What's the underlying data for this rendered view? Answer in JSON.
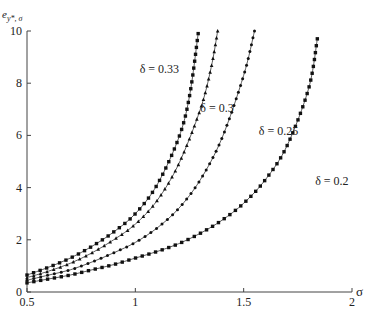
{
  "chart_data": {
    "type": "line",
    "title": "",
    "xlabel": "σ",
    "ylabel": "e_{y*, σ}",
    "xlim": [
      0.5,
      2
    ],
    "ylim": [
      0,
      10
    ],
    "x_ticks": [
      "0.5",
      "1",
      "1.5",
      "2"
    ],
    "y_ticks": [
      "0",
      "2",
      "4",
      "6",
      "8",
      "10"
    ],
    "grid": false,
    "legend": "inline labels",
    "series": [
      {
        "name": "δ = 0.33",
        "marker": "square",
        "x": [
          0.5,
          0.6,
          0.7,
          0.8,
          0.9,
          1.0,
          1.1,
          1.2,
          1.25,
          1.29
        ],
        "y": [
          0.65,
          0.95,
          1.3,
          1.75,
          2.3,
          3.0,
          4.1,
          5.9,
          7.5,
          9.9
        ]
      },
      {
        "name": "δ = 0.3",
        "marker": "triangle",
        "x": [
          0.5,
          0.6,
          0.7,
          0.8,
          0.9,
          1.0,
          1.1,
          1.2,
          1.3,
          1.35,
          1.38
        ],
        "y": [
          0.55,
          0.8,
          1.1,
          1.5,
          2.0,
          2.6,
          3.5,
          4.9,
          7.0,
          8.6,
          10.0
        ]
      },
      {
        "name": "δ = 0.25",
        "marker": "dot",
        "x": [
          0.5,
          0.6,
          0.7,
          0.8,
          0.9,
          1.0,
          1.1,
          1.2,
          1.3,
          1.4,
          1.5,
          1.55
        ],
        "y": [
          0.45,
          0.65,
          0.85,
          1.15,
          1.5,
          1.9,
          2.45,
          3.2,
          4.3,
          5.9,
          8.3,
          10.0
        ]
      },
      {
        "name": "δ = 0.2",
        "marker": "square",
        "x": [
          0.5,
          0.6,
          0.7,
          0.8,
          0.9,
          1.0,
          1.1,
          1.2,
          1.3,
          1.4,
          1.5,
          1.6,
          1.7,
          1.8,
          1.84
        ],
        "y": [
          0.35,
          0.5,
          0.65,
          0.85,
          1.05,
          1.3,
          1.55,
          1.85,
          2.25,
          2.75,
          3.4,
          4.3,
          5.6,
          7.8,
          9.7
        ]
      }
    ],
    "annotations": [
      {
        "text": "δ = 0.33",
        "x": 1.02,
        "y": 8.4
      },
      {
        "text": "δ = 0.3",
        "x": 1.3,
        "y": 6.9
      },
      {
        "text": "δ = 0.25",
        "x": 1.57,
        "y": 6.0
      },
      {
        "text": "δ = 0.2",
        "x": 1.83,
        "y": 4.1
      }
    ]
  },
  "axes": {
    "x_title": "σ",
    "y_title_main": "e",
    "y_title_sub": "y*, σ"
  }
}
